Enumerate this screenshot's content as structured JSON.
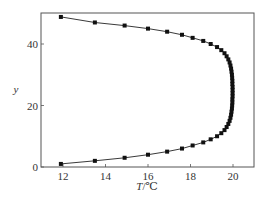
{
  "chart_data": {
    "type": "line",
    "title": "",
    "xlabel": "T/℃",
    "ylabel": "y",
    "xlim": [
      11,
      21
    ],
    "ylim": [
      0,
      50
    ],
    "xticks": [
      12,
      14,
      16,
      18,
      20
    ],
    "yticks": [
      0,
      20,
      40
    ],
    "grid": false,
    "legend": null,
    "marker": "square",
    "series": [
      {
        "name": "temperature profile",
        "x": [
          11.9,
          13.5,
          14.9,
          16.0,
          16.9,
          17.6,
          18.1,
          18.6,
          18.95,
          19.25,
          19.45,
          19.6,
          19.7,
          19.78,
          19.84,
          19.88,
          19.91,
          19.93,
          19.95,
          19.96,
          19.97,
          19.97,
          19.98,
          19.98,
          19.98,
          19.98,
          19.97,
          19.97,
          19.96,
          19.95,
          19.93,
          19.91,
          19.88,
          19.84,
          19.78,
          19.7,
          19.6,
          19.45,
          19.25,
          18.95,
          18.6,
          18.1,
          17.6,
          16.9,
          16.0,
          14.9,
          13.5,
          11.9
        ],
        "y": [
          1,
          2,
          3,
          4,
          5,
          6,
          7,
          8,
          9,
          10,
          11,
          12,
          13,
          14,
          15,
          16,
          17,
          18,
          19,
          20,
          21,
          22,
          23,
          24,
          25,
          26,
          27,
          28,
          29,
          30,
          31,
          32,
          33,
          34,
          35,
          36,
          37,
          38,
          39,
          40,
          41,
          42,
          43,
          44,
          45,
          46,
          47,
          48.8
        ]
      }
    ]
  },
  "axes": {
    "x_label_prefix": "T",
    "x_label_suffix": "/℃",
    "y_label": "y",
    "x_tick_labels": [
      "12",
      "14",
      "16",
      "18",
      "20"
    ],
    "y_tick_labels": [
      "0",
      "20",
      "40"
    ]
  }
}
